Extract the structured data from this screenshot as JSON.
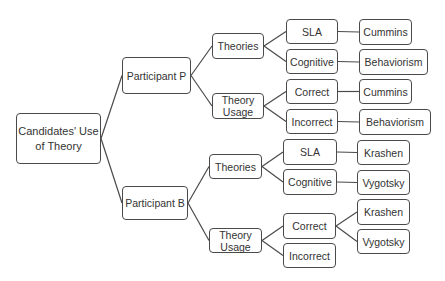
{
  "diagram": {
    "type": "tree",
    "line_color": "#4a4a4a",
    "nodes": {
      "root": "Candidates' Use of Theory",
      "p": "Participant P",
      "p_theories": "Theories",
      "p_theories_sla": "SLA",
      "p_theories_sla_leaf": "Cummins",
      "p_theories_cog": "Cognitive",
      "p_theories_cog_leaf": "Behaviorism",
      "p_usage": "Theory Usage",
      "p_usage_correct": "Correct",
      "p_usage_correct_leaf": "Cummins",
      "p_usage_incorrect": "Incorrect",
      "p_usage_incorrect_leaf": "Behaviorism",
      "b": "Participant B",
      "b_theories": "Theories",
      "b_theories_sla": "SLA",
      "b_theories_sla_leaf": "Krashen",
      "b_theories_cog": "Cognitive",
      "b_theories_cog_leaf": "Vygotsky",
      "b_usage": "Theory Usage",
      "b_usage_correct": "Correct",
      "b_usage_correct_leaf1": "Krashen",
      "b_usage_correct_leaf2": "Vygotsky",
      "b_usage_incorrect": "Incorrect"
    },
    "edges": [
      [
        "root",
        "p"
      ],
      [
        "root",
        "b"
      ],
      [
        "p",
        "p_theories"
      ],
      [
        "p",
        "p_usage"
      ],
      [
        "p_theories",
        "p_theories_sla"
      ],
      [
        "p_theories",
        "p_theories_cog"
      ],
      [
        "p_theories_sla",
        "p_theories_sla_leaf"
      ],
      [
        "p_theories_cog",
        "p_theories_cog_leaf"
      ],
      [
        "p_usage",
        "p_usage_correct"
      ],
      [
        "p_usage",
        "p_usage_incorrect"
      ],
      [
        "p_usage_correct",
        "p_usage_correct_leaf"
      ],
      [
        "p_usage_incorrect",
        "p_usage_incorrect_leaf"
      ],
      [
        "b",
        "b_theories"
      ],
      [
        "b",
        "b_usage"
      ],
      [
        "b_theories",
        "b_theories_sla"
      ],
      [
        "b_theories",
        "b_theories_cog"
      ],
      [
        "b_theories_sla",
        "b_theories_sla_leaf"
      ],
      [
        "b_theories_cog",
        "b_theories_cog_leaf"
      ],
      [
        "b_usage",
        "b_usage_correct"
      ],
      [
        "b_usage",
        "b_usage_incorrect"
      ],
      [
        "b_usage_correct",
        "b_usage_correct_leaf1"
      ],
      [
        "b_usage_correct",
        "b_usage_correct_leaf2"
      ]
    ]
  }
}
